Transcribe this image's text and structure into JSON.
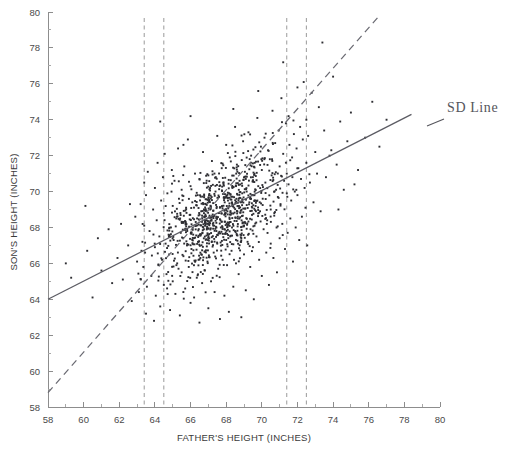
{
  "figure": {
    "name": "fathers-sons-height-scatter",
    "background": "#ffffff",
    "width": 519,
    "height": 457
  },
  "annotations": {
    "sd_line_label": "SD Line"
  },
  "chart_data": {
    "type": "scatter",
    "title": "",
    "xlabel": "FATHER'S HEIGHT (INCHES)",
    "ylabel": "SON'S HEIGHT (INCHES)",
    "xlim": [
      58,
      80
    ],
    "ylim": [
      58,
      80
    ],
    "xticks": [
      58,
      60,
      62,
      64,
      66,
      68,
      70,
      72,
      74,
      76,
      78,
      80
    ],
    "yticks": [
      58,
      60,
      62,
      64,
      66,
      68,
      70,
      72,
      74,
      76,
      78,
      80
    ],
    "xtick_labels": [
      "58",
      "60",
      "62",
      "64",
      "66",
      "68",
      "70",
      "72",
      "74",
      "76",
      "78",
      "80"
    ],
    "ytick_labels": [
      "58",
      "60",
      "62",
      "64",
      "66",
      "68",
      "70",
      "72",
      "74",
      "76",
      "78",
      "80"
    ],
    "minor_tick_step": 1,
    "grid": false,
    "legend": null,
    "marker": {
      "shape": "square",
      "size_px": 1.9,
      "color": "#2e2e33"
    },
    "vertical_reference_lines": [
      {
        "name": "strip-1-left",
        "x": 63.4,
        "style": "dashed",
        "color": "#9a9a9a"
      },
      {
        "name": "strip-1-right",
        "x": 64.5,
        "style": "dashed",
        "color": "#9a9a9a"
      },
      {
        "name": "strip-2-left",
        "x": 71.4,
        "style": "dashed",
        "color": "#9a9a9a"
      },
      {
        "name": "strip-2-right",
        "x": 72.5,
        "style": "dashed",
        "color": "#9a9a9a"
      }
    ],
    "lines": [
      {
        "name": "regression-line",
        "label": "",
        "style": "solid",
        "color": "#5b5b63",
        "x": [
          58,
          78.4
        ],
        "y": [
          64.0,
          74.3
        ]
      },
      {
        "name": "sd-line",
        "label": "SD Line",
        "style": "dashed",
        "color": "#6a6a72",
        "x": [
          58,
          76.6
        ],
        "y": [
          58.8,
          79.8
        ]
      }
    ],
    "n_points": 1078,
    "point_cloud_summary": {
      "x_mean": 67.7,
      "y_mean": 68.7,
      "x_sd": 2.7,
      "y_sd": 2.8,
      "correlation": 0.5
    },
    "points": [
      [
        59.0,
        66.0
      ],
      [
        59.3,
        65.2
      ],
      [
        60.2,
        66.7
      ],
      [
        60.5,
        64.1
      ],
      [
        60.8,
        67.4
      ],
      [
        61.0,
        65.6
      ],
      [
        61.4,
        67.9
      ],
      [
        61.6,
        64.9
      ],
      [
        61.9,
        66.3
      ],
      [
        62.1,
        68.2
      ],
      [
        62.2,
        65.1
      ],
      [
        62.5,
        67.0
      ],
      [
        62.7,
        63.9
      ],
      [
        62.9,
        68.6
      ],
      [
        63.0,
        66.1
      ],
      [
        63.1,
        64.4
      ],
      [
        63.2,
        69.3
      ],
      [
        63.3,
        67.2
      ],
      [
        63.35,
        65.8
      ],
      [
        63.4,
        70.5
      ],
      [
        63.4,
        68.1
      ],
      [
        63.45,
        66.6
      ],
      [
        63.5,
        63.2
      ],
      [
        63.5,
        69.8
      ],
      [
        63.55,
        64.7
      ],
      [
        63.6,
        71.1
      ],
      [
        63.7,
        67.8
      ],
      [
        63.8,
        65.3
      ],
      [
        63.9,
        69.0
      ],
      [
        63.95,
        62.8
      ],
      [
        64.0,
        70.2
      ],
      [
        64.0,
        66.9
      ],
      [
        64.05,
        64.2
      ],
      [
        64.1,
        68.4
      ],
      [
        64.15,
        71.6
      ],
      [
        64.2,
        65.9
      ],
      [
        64.25,
        67.5
      ],
      [
        64.3,
        63.6
      ],
      [
        64.35,
        69.5
      ],
      [
        64.4,
        66.2
      ],
      [
        64.45,
        70.8
      ],
      [
        64.5,
        68.8
      ],
      [
        64.5,
        64.8
      ],
      [
        64.55,
        72.1
      ],
      [
        64.6,
        67.1
      ],
      [
        64.65,
        65.4
      ],
      [
        64.7,
        69.9
      ],
      [
        64.8,
        66.5
      ],
      [
        64.85,
        63.4
      ],
      [
        64.9,
        68.0
      ],
      [
        64.95,
        71.2
      ],
      [
        65.0,
        65.0
      ],
      [
        65.0,
        69.2
      ],
      [
        65.05,
        67.3
      ],
      [
        65.1,
        70.6
      ],
      [
        65.15,
        64.3
      ],
      [
        65.2,
        68.5
      ],
      [
        65.25,
        66.0
      ],
      [
        65.3,
        72.4
      ],
      [
        65.35,
        69.6
      ],
      [
        65.4,
        63.1
      ],
      [
        65.45,
        67.7
      ],
      [
        65.5,
        65.5
      ],
      [
        65.5,
        70.1
      ],
      [
        65.55,
        68.3
      ],
      [
        65.6,
        66.4
      ],
      [
        65.65,
        71.4
      ],
      [
        65.7,
        64.6
      ],
      [
        65.75,
        69.1
      ],
      [
        65.8,
        67.0
      ],
      [
        65.85,
        72.9
      ],
      [
        65.9,
        65.8
      ],
      [
        65.95,
        68.7
      ],
      [
        66.0,
        70.3
      ],
      [
        66.0,
        63.8
      ],
      [
        66.05,
        66.8
      ],
      [
        66.1,
        69.4
      ],
      [
        66.15,
        67.6
      ],
      [
        66.2,
        64.1
      ],
      [
        66.25,
        71.0
      ],
      [
        66.3,
        68.1
      ],
      [
        66.35,
        65.2
      ],
      [
        66.4,
        69.8
      ],
      [
        66.45,
        67.2
      ],
      [
        66.5,
        62.7
      ],
      [
        66.5,
        70.7
      ],
      [
        66.55,
        66.3
      ],
      [
        66.6,
        68.9
      ],
      [
        66.65,
        64.9
      ],
      [
        66.7,
        72.2
      ],
      [
        66.75,
        67.9
      ],
      [
        66.8,
        65.6
      ],
      [
        66.85,
        69.3
      ],
      [
        66.9,
        68.4
      ],
      [
        66.95,
        66.1
      ],
      [
        67.0,
        70.9
      ],
      [
        67.0,
        63.5
      ],
      [
        67.05,
        67.4
      ],
      [
        67.1,
        69.0
      ],
      [
        67.15,
        65.0
      ],
      [
        67.2,
        71.7
      ],
      [
        67.25,
        68.2
      ],
      [
        67.3,
        66.6
      ],
      [
        67.35,
        64.4
      ],
      [
        67.4,
        70.0
      ],
      [
        67.45,
        68.6
      ],
      [
        67.5,
        67.1
      ],
      [
        67.5,
        73.1
      ],
      [
        67.55,
        65.7
      ],
      [
        67.6,
        69.7
      ],
      [
        67.65,
        62.9
      ],
      [
        67.7,
        68.0
      ],
      [
        67.75,
        71.3
      ],
      [
        67.8,
        66.2
      ],
      [
        67.85,
        70.4
      ],
      [
        67.9,
        64.2
      ],
      [
        67.95,
        68.8
      ],
      [
        68.0,
        67.3
      ],
      [
        68.0,
        72.6
      ],
      [
        68.05,
        65.9
      ],
      [
        68.1,
        69.5
      ],
      [
        68.15,
        63.3
      ],
      [
        68.2,
        71.9
      ],
      [
        68.25,
        68.3
      ],
      [
        68.3,
        66.7
      ],
      [
        68.35,
        70.2
      ],
      [
        68.4,
        64.7
      ],
      [
        68.45,
        69.1
      ],
      [
        68.5,
        67.8
      ],
      [
        68.5,
        73.6
      ],
      [
        68.55,
        66.0
      ],
      [
        68.6,
        71.5
      ],
      [
        68.65,
        68.5
      ],
      [
        68.7,
        65.4
      ],
      [
        68.75,
        70.6
      ],
      [
        68.8,
        67.6
      ],
      [
        68.85,
        63.0
      ],
      [
        68.9,
        69.9
      ],
      [
        68.95,
        72.8
      ],
      [
        69.0,
        66.5
      ],
      [
        69.0,
        68.1
      ],
      [
        69.05,
        71.1
      ],
      [
        69.1,
        64.5
      ],
      [
        69.15,
        70.0
      ],
      [
        69.2,
        67.2
      ],
      [
        69.25,
        73.3
      ],
      [
        69.3,
        69.4
      ],
      [
        69.35,
        65.8
      ],
      [
        69.4,
        72.0
      ],
      [
        69.45,
        68.7
      ],
      [
        69.5,
        66.9
      ],
      [
        69.5,
        70.8
      ],
      [
        69.55,
        64.0
      ],
      [
        69.6,
        71.6
      ],
      [
        69.65,
        69.2
      ],
      [
        69.7,
        67.5
      ],
      [
        69.75,
        74.1
      ],
      [
        69.8,
        70.3
      ],
      [
        69.85,
        66.2
      ],
      [
        69.9,
        68.9
      ],
      [
        69.95,
        72.5
      ],
      [
        70.0,
        65.3
      ],
      [
        70.0,
        71.2
      ],
      [
        70.05,
        69.6
      ],
      [
        70.1,
        67.9
      ],
      [
        70.15,
        73.0
      ],
      [
        70.2,
        70.5
      ],
      [
        70.25,
        66.6
      ],
      [
        70.3,
        68.4
      ],
      [
        70.35,
        72.3
      ],
      [
        70.4,
        64.8
      ],
      [
        70.45,
        71.8
      ],
      [
        70.5,
        69.0
      ],
      [
        70.5,
        67.1
      ],
      [
        70.55,
        70.9
      ],
      [
        70.6,
        74.5
      ],
      [
        70.65,
        66.3
      ],
      [
        70.7,
        68.8
      ],
      [
        70.75,
        72.7
      ],
      [
        70.8,
        70.1
      ],
      [
        70.85,
        65.5
      ],
      [
        70.9,
        69.7
      ],
      [
        70.95,
        73.4
      ],
      [
        71.0,
        67.4
      ],
      [
        71.0,
        71.4
      ],
      [
        71.05,
        69.3
      ],
      [
        71.1,
        75.2
      ],
      [
        71.15,
        68.2
      ],
      [
        71.2,
        72.1
      ],
      [
        71.25,
        70.6
      ],
      [
        71.3,
        66.8
      ],
      [
        71.35,
        73.8
      ],
      [
        71.4,
        69.9
      ],
      [
        71.4,
        71.0
      ],
      [
        71.45,
        67.7
      ],
      [
        71.5,
        74.2
      ],
      [
        71.5,
        70.4
      ],
      [
        71.55,
        72.6
      ],
      [
        71.6,
        68.5
      ],
      [
        71.65,
        69.5
      ],
      [
        71.7,
        71.9
      ],
      [
        71.75,
        66.1
      ],
      [
        71.8,
        73.2
      ],
      [
        71.85,
        70.0
      ],
      [
        71.9,
        68.0
      ],
      [
        71.95,
        72.4
      ],
      [
        72.0,
        75.8
      ],
      [
        72.0,
        69.8
      ],
      [
        72.05,
        71.3
      ],
      [
        72.1,
        67.3
      ],
      [
        72.15,
        73.6
      ],
      [
        72.2,
        70.7
      ],
      [
        72.25,
        68.6
      ],
      [
        72.3,
        72.9
      ],
      [
        72.35,
        76.1
      ],
      [
        72.4,
        70.2
      ],
      [
        72.45,
        69.1
      ],
      [
        72.5,
        74.0
      ],
      [
        72.5,
        71.6
      ],
      [
        72.55,
        67.0
      ],
      [
        72.6,
        73.1
      ],
      [
        72.7,
        70.5
      ],
      [
        72.8,
        75.5
      ],
      [
        72.9,
        69.4
      ],
      [
        73.0,
        72.2
      ],
      [
        73.1,
        71.0
      ],
      [
        73.2,
        74.7
      ],
      [
        73.3,
        68.9
      ],
      [
        73.5,
        73.4
      ],
      [
        73.6,
        70.8
      ],
      [
        73.8,
        72.0
      ],
      [
        74.0,
        76.4
      ],
      [
        74.2,
        71.5
      ],
      [
        74.4,
        73.9
      ],
      [
        74.6,
        70.1
      ],
      [
        74.8,
        72.8
      ],
      [
        75.0,
        74.4
      ],
      [
        75.4,
        71.2
      ],
      [
        75.8,
        73.0
      ],
      [
        76.2,
        75.0
      ],
      [
        76.6,
        72.5
      ],
      [
        77.0,
        74.0
      ],
      [
        73.4,
        78.3
      ],
      [
        71.2,
        77.2
      ],
      [
        69.8,
        75.6
      ],
      [
        68.4,
        74.6
      ],
      [
        66.0,
        74.2
      ],
      [
        64.3,
        73.9
      ],
      [
        65.6,
        72.6
      ],
      [
        62.6,
        69.3
      ],
      [
        60.1,
        69.2
      ],
      [
        73.9,
        72.3
      ],
      [
        74.3,
        69.0
      ],
      [
        75.2,
        70.4
      ]
    ]
  }
}
